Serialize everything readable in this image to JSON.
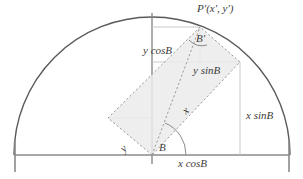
{
  "figure": {
    "type": "geometry-diagram",
    "width": 303,
    "height": 179,
    "colors": {
      "background": "#ffffff",
      "arc": "#5a5a5a",
      "axis": "#8a8a8a",
      "dashed": "#9a9a9a",
      "fill": "#ebebeb",
      "construction": "#c9c9c9",
      "text": "#3b3b3b"
    },
    "geometry": {
      "origin_x": 152,
      "origin_y": 155,
      "radius": 138,
      "rotation_angle_deg": 42,
      "baseline_left_x": 14,
      "baseline_right_x": 290,
      "rect_corner_origin": [
        152,
        155
      ],
      "rect_corner_left": [
        108,
        118
      ],
      "rect_corner_top": [
        200,
        27
      ],
      "rect_corner_right": [
        240,
        62
      ]
    }
  },
  "labels": {
    "point_p_prime": "P′(x′, y′)",
    "angle_b_prime": "B′",
    "angle_b_origin": "B",
    "y_cos_b": "y cosB",
    "y_sin_b": "y sinB",
    "x_sin_b": "x sinB",
    "x_cos_b": "x cosB",
    "side_x": "x",
    "side_y": "y"
  }
}
